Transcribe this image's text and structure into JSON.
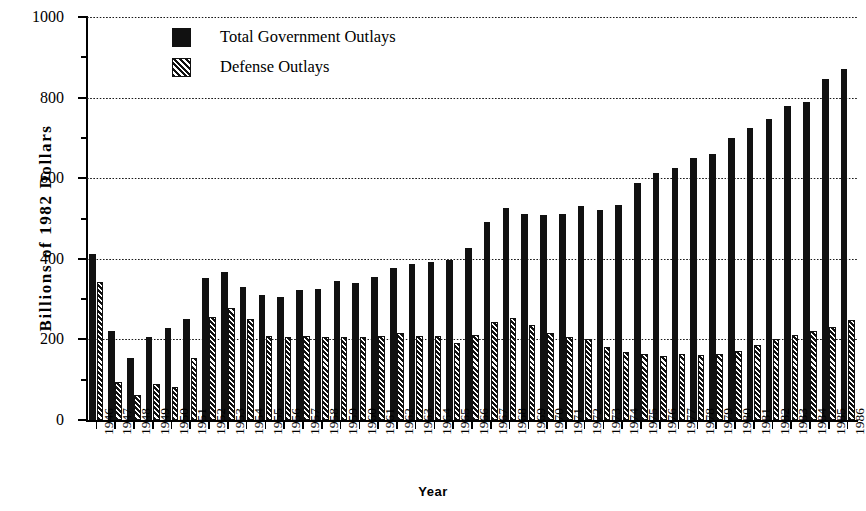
{
  "chart_data": {
    "type": "bar",
    "title": "",
    "xlabel": "Year",
    "ylabel": "Billions  of  1982  Dollars",
    "ylim": [
      0,
      1000
    ],
    "yticks": [
      0,
      200,
      400,
      600,
      800,
      1000
    ],
    "yminorticks": [
      100,
      300,
      500,
      700,
      900
    ],
    "grid": true,
    "grid_axis": "y",
    "legend_position": "top-left-inside",
    "categories": [
      "1946",
      "1947",
      "1948",
      "1949",
      "1950",
      "1951",
      "1952",
      "1953",
      "1954",
      "1955",
      "1956",
      "1957",
      "1958",
      "1959",
      "1960",
      "1961",
      "1962",
      "1963",
      "1964",
      "1965",
      "1966",
      "1967",
      "1968",
      "1969",
      "1970",
      "1971",
      "1972",
      "1973",
      "1974",
      "1975",
      "1976",
      "1977",
      "1978",
      "1979",
      "1980",
      "1981",
      "1982",
      "1983",
      "1984",
      "1985",
      "1986"
    ],
    "series": [
      {
        "name": "Total Government Outlays",
        "fill": "solid-black",
        "values": [
          412,
          220,
          155,
          205,
          228,
          250,
          352,
          368,
          330,
          310,
          305,
          322,
          325,
          345,
          340,
          356,
          378,
          386,
          392,
          398,
          428,
          492,
          525,
          512,
          508,
          512,
          530,
          522,
          534,
          588,
          613,
          625,
          650,
          660,
          700,
          725,
          748,
          780,
          790,
          845,
          870
        ]
      },
      {
        "name": "Defense Outlays",
        "fill": "diagonal-hatch",
        "values": [
          342,
          95,
          62,
          90,
          82,
          155,
          255,
          278,
          250,
          208,
          205,
          208,
          205,
          205,
          205,
          208,
          215,
          208,
          208,
          192,
          212,
          242,
          252,
          235,
          215,
          207,
          200,
          182,
          170,
          163,
          158,
          163,
          162,
          165,
          172,
          186,
          200,
          212,
          222,
          232,
          248
        ]
      }
    ]
  },
  "legend": {
    "items": [
      {
        "label": "Total Government Outlays",
        "swatch": "solid-black"
      },
      {
        "label": "Defense Outlays",
        "swatch": "diagonal-hatch"
      }
    ]
  },
  "axes": {
    "y_title": "Billions  of  1982  Dollars",
    "x_title": "Year"
  }
}
